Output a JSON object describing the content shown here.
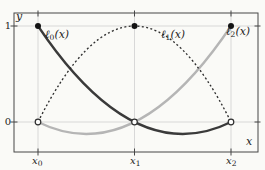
{
  "figure": {
    "colors": {
      "background": "#fafaf7",
      "frame": "#474747",
      "grid": "#cfcfcf",
      "tick": "#474747",
      "text": "#1c1c1c",
      "marker_fill": "#141414",
      "marker_open_fill": "#fdfdfc",
      "marker_stroke": "#2f2f2f"
    },
    "axis_labels": {
      "x": "x",
      "y": "y"
    },
    "y_tick_labels": {
      "one": "1",
      "zero": "0"
    },
    "x_tick_labels": [
      {
        "main": "x",
        "sub": "0"
      },
      {
        "main": "x",
        "sub": "1"
      },
      {
        "main": "x",
        "sub": "2"
      }
    ],
    "grid": {
      "x": [
        0,
        1,
        2
      ],
      "y": [
        0,
        1
      ]
    },
    "curves": [
      {
        "id": "l0",
        "label_main": "ℓ",
        "label_sub": "0",
        "label_suffix": "(x)",
        "color": "#3a3a3a",
        "width": 2.3,
        "dash": "",
        "p0": [
          0,
          1
        ],
        "ctrl": [
          1,
          -0.5
        ],
        "p1": [
          2,
          0
        ]
      },
      {
        "id": "l1",
        "label_main": "ℓ",
        "label_sub": "1",
        "label_suffix": "(x)",
        "color": "#2e2e2e",
        "width": 1.35,
        "dash": "2 2.4",
        "p0": [
          0,
          0
        ],
        "ctrl": [
          1,
          2
        ],
        "p1": [
          2,
          0
        ]
      },
      {
        "id": "l2",
        "label_main": "ℓ",
        "label_sub": "2",
        "label_suffix": "(x)",
        "color": "#b5b5b5",
        "width": 2.3,
        "dash": "",
        "p0": [
          0,
          0
        ],
        "ctrl": [
          1,
          -0.5
        ],
        "p1": [
          2,
          1
        ]
      }
    ],
    "markers": {
      "filled": [
        [
          0,
          1
        ],
        [
          1,
          1
        ],
        [
          2,
          1
        ]
      ],
      "open": [
        [
          0,
          0
        ],
        [
          1,
          0
        ],
        [
          2,
          0
        ]
      ]
    }
  },
  "chart_data": {
    "type": "line",
    "title": "",
    "xlabel": "x",
    "ylabel": "y",
    "x_tick_labels": [
      "x₀",
      "x₁",
      "x₂"
    ],
    "y_tick_values": [
      0,
      1
    ],
    "ylim": [
      -0.2,
      1.1
    ],
    "grid": true,
    "x_normalized": [
      0,
      0.25,
      0.5,
      0.75,
      1,
      1.25,
      1.5,
      1.75,
      2
    ],
    "series": [
      {
        "name": "ℓ₀(x)",
        "style": "solid dark",
        "values": [
          1,
          0.656,
          0.375,
          0.156,
          0,
          -0.094,
          -0.125,
          -0.094,
          0
        ]
      },
      {
        "name": "ℓ₁(x)",
        "style": "dotted dark",
        "values": [
          0,
          0.438,
          0.75,
          0.938,
          1,
          0.938,
          0.75,
          0.438,
          0
        ]
      },
      {
        "name": "ℓ₂(x)",
        "style": "solid light-gray",
        "values": [
          0,
          -0.094,
          -0.125,
          -0.094,
          0,
          0.156,
          0.375,
          0.656,
          1
        ]
      }
    ],
    "annotations": [
      "filled dot at y=1 above each curve's own node",
      "open circle at y=0 at each node"
    ]
  }
}
